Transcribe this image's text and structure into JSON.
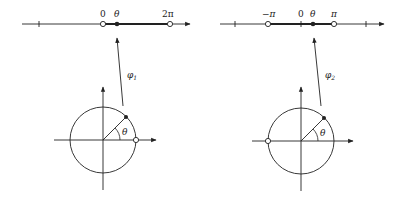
{
  "diagram": {
    "left": {
      "map_label": "φ1",
      "map_symbol": "φ",
      "map_subscript": "1",
      "axis_labels": {
        "zero": "0",
        "theta": "θ",
        "end": "2π"
      },
      "circle_angle_label": "θ"
    },
    "right": {
      "map_label": "φ2",
      "map_symbol": "φ",
      "map_subscript": "2",
      "axis_labels": {
        "start": "−π",
        "zero": "0",
        "theta": "θ",
        "end": "π"
      },
      "circle_angle_label": "θ"
    },
    "colors": {
      "ink": "#222222",
      "background": "#ffffff"
    }
  }
}
